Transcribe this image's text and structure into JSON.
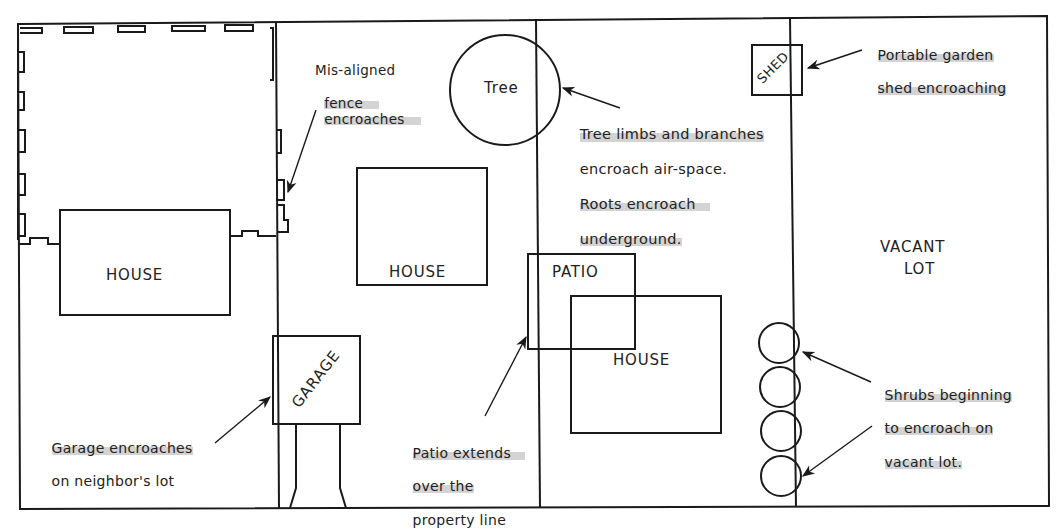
{
  "diagram": {
    "lots": [
      {
        "id": "lot-1",
        "structures": [
          "HOUSE"
        ]
      },
      {
        "id": "lot-2",
        "structures": [
          "HOUSE",
          "GARAGE",
          "Tree"
        ]
      },
      {
        "id": "lot-3",
        "structures": [
          "PATIO",
          "HOUSE",
          "SHED",
          "shrubs"
        ]
      },
      {
        "id": "lot-4",
        "structures": [
          "VACANT LOT"
        ]
      }
    ],
    "labels": {
      "house1": "HOUSE",
      "house2": "HOUSE",
      "house3": "HOUSE",
      "garage": "GARAGE",
      "patio": "PATIO",
      "tree": "Tree",
      "shed": "SHED",
      "vacant_line1": "VACANT",
      "vacant_line2": "LOT"
    },
    "annotations": {
      "fence": [
        "Mis-aligned",
        "fence",
        "encroaches"
      ],
      "tree": [
        "Tree limbs and branches",
        "encroach air-space.",
        "Roots encroach",
        "underground."
      ],
      "shed": [
        "Portable garden",
        "shed encroaching"
      ],
      "garage": [
        "Garage encroaches",
        "on neighbor's lot"
      ],
      "patio": [
        "Patio extends",
        "over the",
        "property line"
      ],
      "shrubs": [
        "Shrubs beginning",
        "to encroach on",
        "vacant lot."
      ]
    },
    "colors": {
      "line": "#1a1a1a",
      "highlight": "#afafaf",
      "background": "#ffffff"
    }
  }
}
